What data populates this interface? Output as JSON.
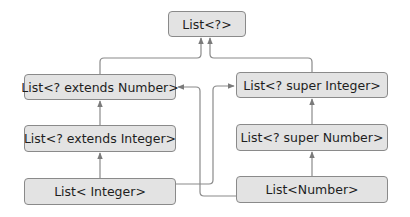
{
  "diagram": {
    "colors": {
      "node_fill": "#e3e3e3",
      "node_border": "#8a8a8a",
      "edge": "#808080",
      "text": "#1e1e1e"
    },
    "nodes": [
      {
        "id": "wildcard",
        "label": "List<?>"
      },
      {
        "id": "extends_number",
        "label": "List<? extends Number>"
      },
      {
        "id": "super_integer",
        "label": "List<? super Integer>"
      },
      {
        "id": "extends_integer",
        "label": "List<? extends Integer>"
      },
      {
        "id": "super_number",
        "label": "List<? super Number>"
      },
      {
        "id": "integer",
        "label": "List< Integer>"
      },
      {
        "id": "number",
        "label": "List<Number>"
      }
    ],
    "edges": [
      {
        "from": "extends_number",
        "to": "wildcard"
      },
      {
        "from": "super_integer",
        "to": "wildcard"
      },
      {
        "from": "extends_integer",
        "to": "extends_number"
      },
      {
        "from": "integer",
        "to": "extends_integer"
      },
      {
        "from": "super_number",
        "to": "super_integer"
      },
      {
        "from": "number",
        "to": "super_number"
      },
      {
        "from": "integer",
        "to": "super_integer"
      },
      {
        "from": "number",
        "to": "extends_number"
      }
    ]
  }
}
